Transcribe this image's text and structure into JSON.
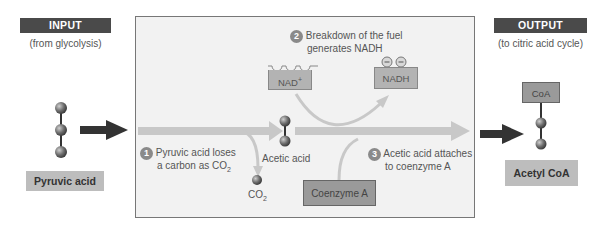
{
  "input": {
    "header": "INPUT",
    "source": "(from glycolysis)",
    "molecule_label": "Pyruvic acid"
  },
  "output": {
    "header": "OUTPUT",
    "destination": "(to citric acid cycle)",
    "molecule_label": "Acetyl CoA",
    "coa_tag": "CoA"
  },
  "process": {
    "steps": [
      {
        "number": "1",
        "line1": "Pyruvic acid loses",
        "line2": "a carbon as CO",
        "sub": "2"
      },
      {
        "number": "2",
        "line1": "Breakdown of the fuel",
        "line2": "generates NADH"
      },
      {
        "number": "3",
        "line1": "Acetic acid attaches",
        "line2": "to coenzyme A"
      }
    ],
    "nad_plus": {
      "base": "NAD",
      "sup": "+"
    },
    "nadh": "NADH",
    "acetic_acid": "Acetic acid",
    "co2": {
      "base": "CO",
      "sub": "2"
    },
    "coenzyme_a": "Coenzyme A"
  },
  "colors": {
    "header_bg": "#4a4a4a",
    "label_bg": "#bdbdbd",
    "process_bg": "#f2f2f2",
    "flow_arrow": "#c8c8c8",
    "dark_arrow": "#333333",
    "step_badge": "#8a8a8a",
    "atom": "#6e6e6e"
  }
}
